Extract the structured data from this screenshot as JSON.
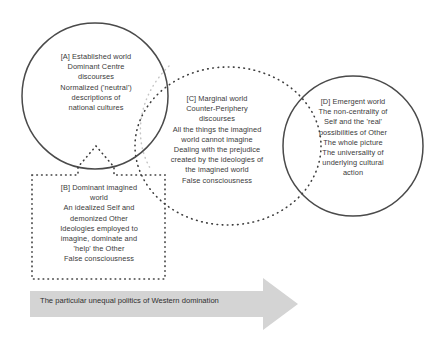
{
  "diagram": {
    "background_color": "#ffffff",
    "text_color": "#3a3a3a",
    "solid_stroke_color": "#4a4a4a",
    "dotted_stroke_color": "#3d3d3d",
    "faint_dotted_stroke_color": "#c0c0c0",
    "arrow_fill_color": "#d4d4d4"
  },
  "nodes": {
    "a": {
      "key": "A",
      "shape": "circle",
      "label": "[A] Established world\nDominant Centre\ndiscourses\nNormalized ('neutral')\ndescriptions of\nnational cultures"
    },
    "b": {
      "key": "B",
      "shape": "dotted-rectangle",
      "label": "[B] Dominant imagined\nworld\nAn idealized Self and\ndemonized Other\nIdeologies employed to\nimagine, dominate and\n'help' the Other\nFalse consciousness"
    },
    "c": {
      "key": "C",
      "shape": "dotted-ellipse",
      "label": "[C] Marginal world\nCounter-Periphery\ndiscourses\nAll the things the imagined\nworld cannot imagine\nDealing with the prejudice\ncreated by the ideologies of\nthe imagined world\nFalse consciousness"
    },
    "d": {
      "key": "D",
      "shape": "circle",
      "label": "[D] Emergent world\nThe non-centrality of\nSelf and the 'real'\npossibilities of Other\nThe whole picture\nThe universality of\nunderlying cultural\naction"
    }
  },
  "arrow": {
    "caption": "The particular unequal politics of Western domination",
    "direction": "right"
  }
}
